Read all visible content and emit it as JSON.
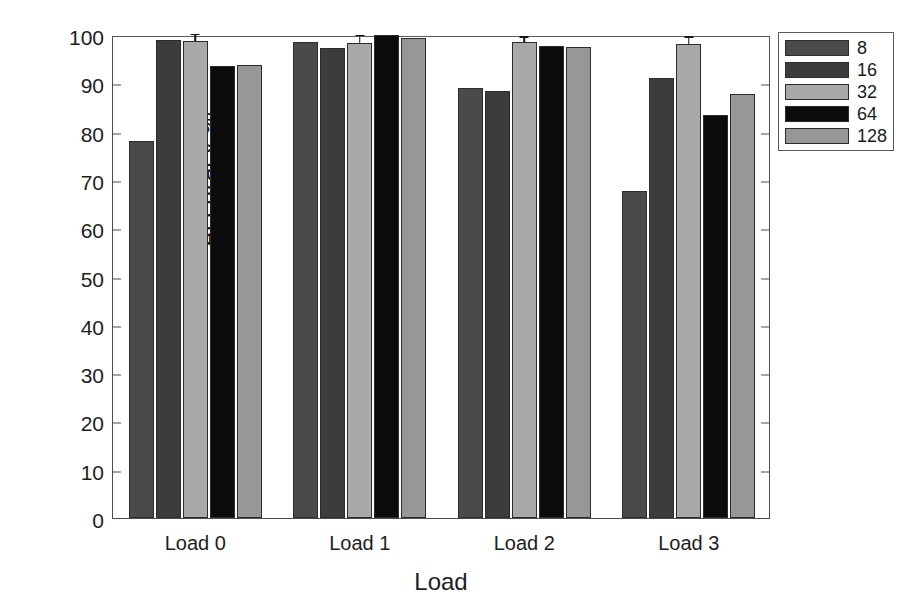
{
  "chart_data": {
    "type": "bar",
    "title": "",
    "xlabel": "Load",
    "ylabel": "Accuracy %",
    "categories": [
      "Load 0",
      "Load 1",
      "Load 2",
      "Load 3"
    ],
    "ylim": [
      0,
      100
    ],
    "yticks": [
      0,
      10,
      20,
      30,
      40,
      50,
      60,
      70,
      80,
      90,
      100
    ],
    "ytick_labels": [
      "0",
      "10",
      "20",
      "30",
      "40",
      "50",
      "60",
      "70",
      "80",
      "90",
      "100"
    ],
    "grid": false,
    "legend_position": "top-right",
    "legend_title": "",
    "series": [
      {
        "name": "8",
        "color": "#4a4a4a",
        "values": [
          78.0,
          98.5,
          89.1,
          67.8
        ],
        "errors": [
          0,
          0,
          0,
          0
        ]
      },
      {
        "name": "16",
        "color": "#3c3c3c",
        "values": [
          99.0,
          97.4,
          88.5,
          91.0
        ],
        "errors": [
          0,
          0,
          0,
          0
        ]
      },
      {
        "name": "32",
        "color": "#a9a9a9",
        "values": [
          98.7,
          98.4,
          98.5,
          98.2
        ],
        "errors": [
          1.3,
          1.3,
          0.9,
          1.2
        ]
      },
      {
        "name": "64",
        "color": "#0c0c0c",
        "values": [
          93.6,
          100.0,
          97.7,
          83.5
        ],
        "errors": [
          0,
          0,
          0,
          0
        ]
      },
      {
        "name": "128",
        "color": "#979797",
        "values": [
          93.8,
          99.4,
          97.6,
          87.7
        ],
        "errors": [
          0,
          0,
          0,
          0
        ]
      }
    ]
  },
  "axes": {
    "y_label": "Accuracy %",
    "x_label": "Load"
  },
  "legend": {
    "items": [
      {
        "label": "8",
        "color": "#4a4a4a"
      },
      {
        "label": "16",
        "color": "#3c3c3c"
      },
      {
        "label": "32",
        "color": "#a9a9a9"
      },
      {
        "label": "64",
        "color": "#0c0c0c"
      },
      {
        "label": "128",
        "color": "#979797"
      }
    ]
  }
}
